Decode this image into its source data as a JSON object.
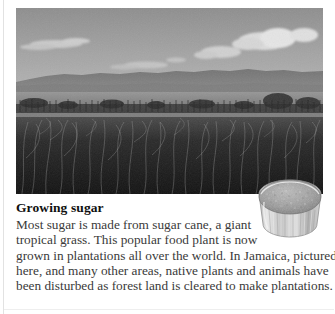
{
  "page": {
    "background_color": "#ffffff",
    "text_color": "#3a3a3a",
    "heading_color": "#101010"
  },
  "photo": {
    "name": "sugar-cane-field-photograph",
    "alt": "Black and white photograph of a sugar cane plantation field with distant hills and a cloudy sky",
    "subject": "sugar cane plantation in Jamaica",
    "palette": {
      "sky": "#9a9a9a",
      "clouds": "#d8d8d8",
      "hills": "#6e6e6e",
      "midfield": "#8a8a8a",
      "foreground": "#1d1d1d"
    }
  },
  "inset": {
    "name": "bowl-of-sugar-photograph",
    "alt": "Cut-out photograph of a glass bowl filled with granulated sugar",
    "palette": {
      "glass": "#d5d5d5",
      "sugar": "#9b9b9b",
      "rim": "#6f6f6f"
    }
  },
  "caption": {
    "title": "Growing sugar",
    "lines": [
      "Most sugar is made from sugar cane, a giant",
      "tropical grass. This popular food plant is now",
      "grown in plantations all over the world. In Jamaica, pictured",
      "here, and many other areas, native plants and animals have",
      "been disturbed as forest land is cleared to make plantations."
    ],
    "full_text": "Most sugar is made from sugar cane, a giant tropical grass. This popular food plant is now grown in plantations all over the world. In Jamaica, pictured here, and many other areas, native plants and animals have been disturbed as forest land is cleared to make plantations."
  }
}
